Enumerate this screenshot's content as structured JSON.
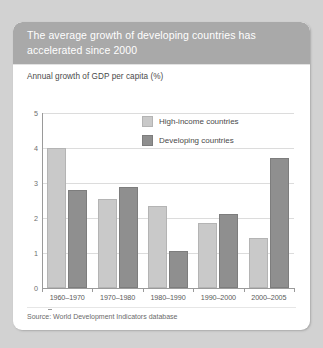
{
  "card": {
    "header_title": "The average growth of developing countries has accelerated since 2000",
    "subtitle": "Annual growth of GDP per capita (%)",
    "source": "Source: World Development Indicators database"
  },
  "colors": {
    "page_background": "#d2d2d2",
    "card_background": "#ffffff",
    "header_band": "#a9a9a9",
    "header_text": "#ffffff",
    "series_high_income": "#c9c9c9",
    "series_developing": "#8f8f8f",
    "gridline": "#dcdcdc",
    "axis": "#9a9a9a"
  },
  "chart_data": {
    "type": "bar",
    "title": "The average growth of developing countries has accelerated since 2000",
    "subtitle": "Annual growth of GDP per capita (%)",
    "xlabel": "",
    "ylabel": "",
    "ylim": [
      0,
      5
    ],
    "yticks": [
      0,
      1,
      2,
      3,
      4,
      5
    ],
    "ytick_labels": [
      "0",
      "1",
      "2",
      "3",
      "4",
      "5"
    ],
    "grid": true,
    "legend_position": "inside-top-center",
    "categories": [
      "1960–1970",
      "1970–1980",
      "1980–1990",
      "1990–2000",
      "2000–2005"
    ],
    "series": [
      {
        "name": "High-income countries",
        "color": "#c9c9c9",
        "values": [
          4.0,
          2.55,
          2.35,
          1.85,
          1.42
        ]
      },
      {
        "name": "Developing countries",
        "color": "#8f8f8f",
        "values": [
          2.8,
          2.88,
          1.05,
          2.12,
          3.72
        ]
      }
    ],
    "source": "Source: World Development Indicators database"
  }
}
